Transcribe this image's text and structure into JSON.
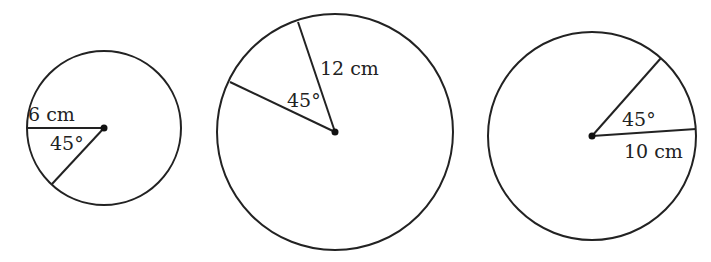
{
  "diagram": {
    "type": "circles-with-sectors",
    "stroke_color": "#222222",
    "circles": [
      {
        "id": "circle-1",
        "center": [
          104,
          128
        ],
        "radius_px": 77,
        "radius_label": "6 cm",
        "angle_label": "45°",
        "radius_end_a": [
          27,
          128
        ],
        "radius_end_b": [
          52,
          184
        ],
        "radius_label_pos": [
          28,
          121
        ],
        "angle_label_pos": [
          50,
          150
        ]
      },
      {
        "id": "circle-2",
        "center": [
          335,
          132
        ],
        "radius_px": 118,
        "radius_label": "12 cm",
        "angle_label": "45°",
        "radius_end_a": [
          298,
          22
        ],
        "radius_end_b": [
          230,
          82
        ],
        "radius_label_pos": [
          320,
          75
        ],
        "angle_label_pos": [
          287,
          107
        ]
      },
      {
        "id": "circle-3",
        "center": [
          592,
          136
        ],
        "radius_px": 104,
        "radius_label": "10 cm",
        "angle_label": "45°",
        "radius_end_a": [
          696,
          129
        ],
        "radius_end_b": [
          661,
          58
        ],
        "radius_label_pos": [
          624,
          158
        ],
        "angle_label_pos": [
          622,
          126
        ]
      }
    ]
  }
}
